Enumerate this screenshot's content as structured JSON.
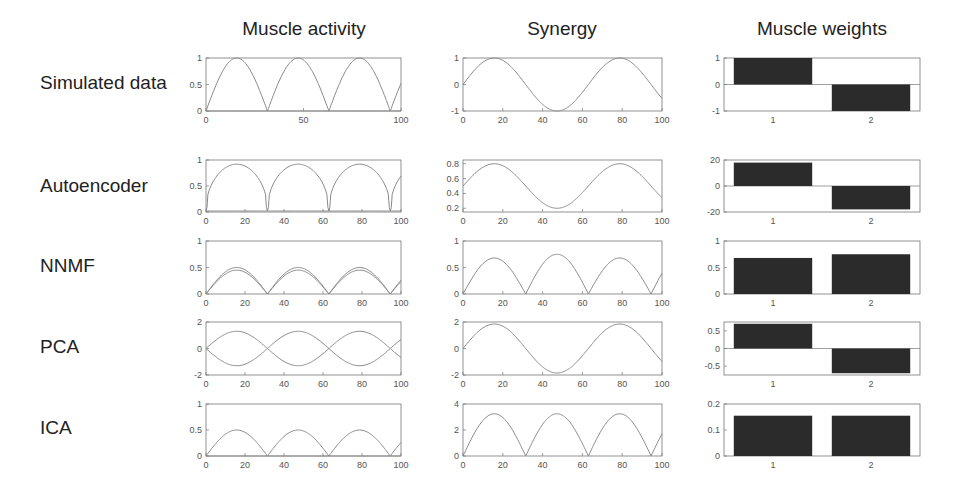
{
  "figure": {
    "column_titles": [
      "Muscle activity",
      "Synergy",
      "Muscle weights"
    ],
    "row_labels": [
      "Simulated data",
      "Autoencoder",
      "NNMF",
      "PCA",
      "ICA"
    ],
    "colors": {
      "line": "#8a8a8a",
      "bar": "#2b2b2b",
      "axis": "#777777",
      "text": "#222222"
    }
  },
  "chart_data": [
    {
      "row": "Simulated data",
      "column": "Muscle activity",
      "type": "line",
      "xlim": [
        0,
        100
      ],
      "ylim": [
        0,
        1
      ],
      "xticks": [
        0,
        50,
        100
      ],
      "yticks": [
        0,
        0.5,
        1
      ],
      "series": [
        {
          "name": "muscle 1",
          "formula": "|sin(2*pi*x/63)|",
          "peak": 1
        },
        {
          "name": "muscle 2",
          "formula": "flat near 0",
          "value": 0
        }
      ]
    },
    {
      "row": "Simulated data",
      "column": "Synergy",
      "type": "line",
      "xlim": [
        0,
        100
      ],
      "ylim": [
        -1,
        1
      ],
      "xticks": [
        0,
        20,
        40,
        60,
        80,
        100
      ],
      "yticks": [
        -1,
        0,
        1
      ],
      "series": [
        {
          "name": "synergy",
          "formula": "sin(2*pi*x/63)",
          "amplitude": 1
        }
      ]
    },
    {
      "row": "Simulated data",
      "column": "Muscle weights",
      "type": "bar",
      "categories": [
        "1",
        "2"
      ],
      "values": [
        1,
        -1
      ],
      "ylim": [
        -1,
        1
      ],
      "yticks": [
        -1,
        0,
        1
      ]
    },
    {
      "row": "Autoencoder",
      "column": "Muscle activity",
      "type": "line",
      "xlim": [
        0,
        100
      ],
      "ylim": [
        0,
        1
      ],
      "xticks": [
        0,
        20,
        40,
        60,
        80,
        100
      ],
      "yticks": [
        0,
        0.5,
        1
      ],
      "series": [
        {
          "name": "muscle 1",
          "shape": "flattened rectified sine",
          "peak": 0.92
        },
        {
          "name": "muscle 2",
          "value": 0.02
        }
      ]
    },
    {
      "row": "Autoencoder",
      "column": "Synergy",
      "type": "line",
      "xlim": [
        0,
        100
      ],
      "ylim": [
        0.15,
        0.85
      ],
      "xticks": [
        0,
        20,
        40,
        60,
        80,
        100
      ],
      "yticks": [
        0.2,
        0.4,
        0.6,
        0.8
      ],
      "series": [
        {
          "name": "synergy",
          "formula": "0.5 + 0.3*sin(2*pi*x/63)",
          "max": 0.8,
          "min": 0.2
        }
      ]
    },
    {
      "row": "Autoencoder",
      "column": "Muscle weights",
      "type": "bar",
      "categories": [
        "1",
        "2"
      ],
      "values": [
        18,
        -18
      ],
      "ylim": [
        -20,
        20
      ],
      "yticks": [
        -20,
        0,
        20
      ]
    },
    {
      "row": "NNMF",
      "column": "Muscle activity",
      "type": "line",
      "xlim": [
        0,
        100
      ],
      "ylim": [
        0,
        1
      ],
      "xticks": [
        0,
        20,
        40,
        60,
        80,
        100
      ],
      "yticks": [
        0,
        0.5,
        1
      ],
      "series": [
        {
          "name": "muscle 1",
          "shape": "rectified sine",
          "peak": 0.5
        },
        {
          "name": "muscle 2",
          "shape": "rectified sine",
          "peak": 0.45
        }
      ]
    },
    {
      "row": "NNMF",
      "column": "Synergy",
      "type": "line",
      "xlim": [
        0,
        100
      ],
      "ylim": [
        0,
        1
      ],
      "xticks": [
        0,
        20,
        40,
        60,
        80,
        100
      ],
      "yticks": [
        0,
        0.5,
        1
      ],
      "series": [
        {
          "name": "synergy",
          "shape": "rectified sine",
          "peaks": [
            0.68,
            0.75,
            0.68
          ]
        }
      ]
    },
    {
      "row": "NNMF",
      "column": "Muscle weights",
      "type": "bar",
      "categories": [
        "1",
        "2"
      ],
      "values": [
        0.68,
        0.75
      ],
      "ylim": [
        0,
        1
      ],
      "yticks": [
        0,
        0.5,
        1
      ]
    },
    {
      "row": "PCA",
      "column": "Muscle activity",
      "type": "line",
      "xlim": [
        0,
        100
      ],
      "ylim": [
        -2,
        2
      ],
      "xticks": [
        0,
        20,
        40,
        60,
        80,
        100
      ],
      "yticks": [
        -2,
        0,
        2
      ],
      "series": [
        {
          "name": "muscle 1",
          "formula": "1.3*sin(2*pi*x/63)"
        },
        {
          "name": "muscle 2",
          "formula": "-1.3*sin(2*pi*x/63)"
        }
      ]
    },
    {
      "row": "PCA",
      "column": "Synergy",
      "type": "line",
      "xlim": [
        0,
        100
      ],
      "ylim": [
        -2,
        2
      ],
      "xticks": [
        0,
        20,
        40,
        60,
        80,
        100
      ],
      "yticks": [
        -2,
        0,
        2
      ],
      "series": [
        {
          "name": "synergy",
          "formula": "1.85*sin(2*pi*x/63)"
        }
      ]
    },
    {
      "row": "PCA",
      "column": "Muscle weights",
      "type": "bar",
      "categories": [
        "1",
        "2"
      ],
      "values": [
        0.7,
        -0.7
      ],
      "ylim": [
        -0.75,
        0.75
      ],
      "yticks": [
        -0.5,
        0,
        0.5
      ]
    },
    {
      "row": "ICA",
      "column": "Muscle activity",
      "type": "line",
      "xlim": [
        0,
        100
      ],
      "ylim": [
        0,
        1
      ],
      "xticks": [
        0,
        20,
        40,
        60,
        80,
        100
      ],
      "yticks": [
        0,
        0.5,
        1
      ],
      "series": [
        {
          "name": "muscle 1",
          "shape": "rectified sine",
          "peak": 0.5
        },
        {
          "name": "muscle 2",
          "value": 0
        }
      ]
    },
    {
      "row": "ICA",
      "column": "Synergy",
      "type": "line",
      "xlim": [
        0,
        100
      ],
      "ylim": [
        0,
        4
      ],
      "xticks": [
        0,
        20,
        40,
        60,
        80,
        100
      ],
      "yticks": [
        0,
        2,
        4
      ],
      "series": [
        {
          "name": "synergy",
          "shape": "rectified sine",
          "peak": 3.25
        }
      ]
    },
    {
      "row": "ICA",
      "column": "Muscle weights",
      "type": "bar",
      "categories": [
        "1",
        "2"
      ],
      "values": [
        0.155,
        0.155
      ],
      "ylim": [
        0,
        0.2
      ],
      "yticks": [
        0,
        0.1,
        0.2
      ]
    }
  ]
}
